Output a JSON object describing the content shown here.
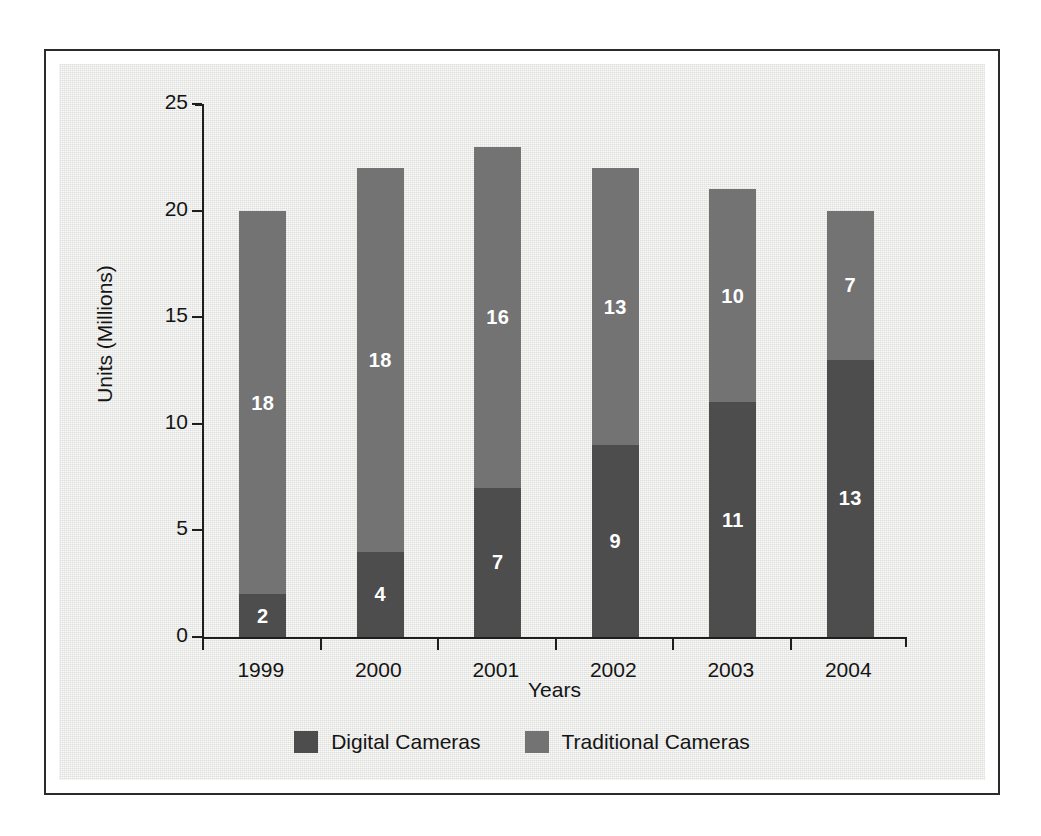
{
  "chart_data": {
    "type": "bar",
    "stacked": true,
    "title": "",
    "xlabel": "Years",
    "ylabel": "Units (Millions)",
    "categories": [
      "1999",
      "2000",
      "2001",
      "2002",
      "2003",
      "2004"
    ],
    "series": [
      {
        "name": "Digital Cameras",
        "color": "#4d4d4d",
        "values": [
          2,
          4,
          7,
          9,
          11,
          13
        ]
      },
      {
        "name": "Traditional Cameras",
        "color": "#737373",
        "values": [
          18,
          18,
          16,
          13,
          10,
          7
        ]
      }
    ],
    "totals": [
      20,
      22,
      23,
      22,
      21,
      20
    ],
    "ylim": [
      0,
      25
    ],
    "yticks": [
      0,
      5,
      10,
      15,
      20,
      25
    ],
    "ytick_labels": [
      "0",
      "5",
      "10",
      "15",
      "20",
      "25"
    ],
    "grid": false,
    "legend_position": "bottom",
    "value_labels": true,
    "value_label_color": "#ffffff"
  },
  "figure": {
    "background": "#e9e9e7",
    "frame_color": "#2b2b2b",
    "axis_color": "#1e1e1e",
    "text_color": "#141414"
  },
  "legend": {
    "items": [
      {
        "label": "Digital Cameras",
        "color": "#4d4d4d"
      },
      {
        "label": "Traditional Cameras",
        "color": "#737373"
      }
    ]
  }
}
